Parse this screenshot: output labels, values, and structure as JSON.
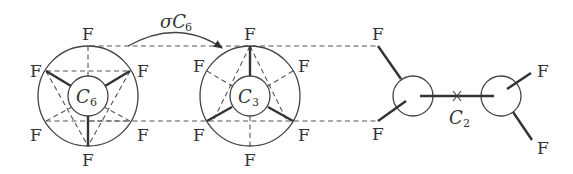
{
  "diagram": {
    "atom_label": "F",
    "operation_label": {
      "prefix": "σ",
      "main": "C",
      "sub": "6"
    },
    "projections": [
      {
        "name": "staggered-view",
        "axis_main": "C",
        "axis_sub": "6"
      },
      {
        "name": "eclipsed-view",
        "axis_main": "C",
        "axis_sub": "3"
      },
      {
        "name": "side-view",
        "axis_main": "C",
        "axis_sub": "2"
      }
    ]
  }
}
